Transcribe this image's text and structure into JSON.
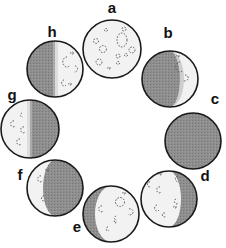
{
  "diagram": {
    "type": "moon-phases-ring",
    "colors": {
      "dark": "#8c8c8c",
      "light": "#f2f2f2",
      "outline": "#1a1a1a",
      "crater": "#555555"
    },
    "phases": [
      {
        "label": "a",
        "cx": 112,
        "cy": 49,
        "r": 29,
        "lit": "full",
        "lx": 112,
        "ly": 13
      },
      {
        "label": "b",
        "cx": 170,
        "cy": 79,
        "r": 28,
        "lit": "right-crescent",
        "lx": 168,
        "ly": 38
      },
      {
        "label": "c",
        "cx": 193,
        "cy": 141,
        "r": 28,
        "lit": "new",
        "lx": 215,
        "ly": 104
      },
      {
        "label": "d",
        "cx": 169,
        "cy": 199,
        "r": 28,
        "lit": "left-gibbous",
        "lx": 205,
        "ly": 181
      },
      {
        "label": "e",
        "cx": 111,
        "cy": 214,
        "r": 28,
        "lit": "right-gibbous",
        "lx": 77,
        "ly": 232
      },
      {
        "label": "f",
        "cx": 55,
        "cy": 188,
        "r": 28,
        "lit": "left-crescent",
        "lx": 20,
        "ly": 180
      },
      {
        "label": "g",
        "cx": 30,
        "cy": 129,
        "r": 29,
        "lit": "left-half",
        "lx": 12,
        "ly": 100
      },
      {
        "label": "h",
        "cx": 55,
        "cy": 69,
        "r": 28,
        "lit": "right-half",
        "lx": 52,
        "ly": 37
      }
    ]
  }
}
